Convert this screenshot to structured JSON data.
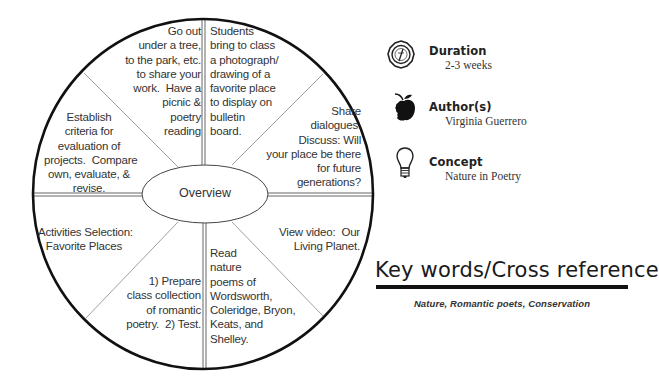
{
  "wheel": {
    "center_label": "Overview",
    "segments": [
      {
        "id": "top-left",
        "text": "Go out\nunder a tree,\nto the park, etc.\nto share your\nwork.  Have a\npicnic &\npoetry\nreading"
      },
      {
        "id": "top-right",
        "text": "Students\nbring to class\na photograph/\ndrawing of a\nfavorite place\nto display on\nbulletin\nboard."
      },
      {
        "id": "upper-right",
        "text": "Share\ndialogues.\nDiscuss: Will\nyour place be there\nfor future\ngenerations?"
      },
      {
        "id": "lower-right",
        "text": "View video:  Our\nLiving Planet."
      },
      {
        "id": "bottom-right",
        "text": "Read\nnature\npoems of\nWordsworth,\nColeridge, Bryon,\nKeats, and\nShelley."
      },
      {
        "id": "bottom-left",
        "text": "1) Prepare\nclass collection\nof romantic\npoetry.  2) Test."
      },
      {
        "id": "lower-left",
        "text": "Activities Selection:\nFavorite Places"
      },
      {
        "id": "upper-left",
        "text": "Establish\ncriteria for\nevaluation of\nprojects.  Compare\nown, evaluate, &\nrevise."
      }
    ]
  },
  "info": {
    "duration": {
      "icon": "compass-icon",
      "title": "Duration",
      "value": "2-3 weeks"
    },
    "authors": {
      "icon": "apple-icon",
      "title": "Author(s)",
      "value": "Virginia Guerrero"
    },
    "concept": {
      "icon": "lightbulb-icon",
      "title": "Concept",
      "value": "Nature in Poetry"
    }
  },
  "keywords": {
    "heading": "Key words/Cross reference",
    "values": "Nature, Romantic poets, Conservation"
  },
  "colors": {
    "ink": "#111111",
    "text": "#333333",
    "divider": "#777777",
    "background": "#ffffff"
  }
}
